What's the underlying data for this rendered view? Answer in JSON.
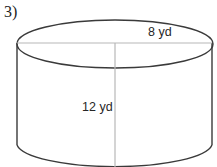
{
  "figure": {
    "problem_number": "3)",
    "shape": "cylinder",
    "diameter_label": "8 yd",
    "height_label": "12 yd",
    "colors": {
      "outline": "#3a3a3a",
      "guide_line": "#b8b8b8",
      "background": "#ffffff",
      "text": "#262626"
    },
    "geometry": {
      "center_x": 115,
      "top_ellipse_center_y": 44,
      "radius_x": 98,
      "radius_y": 24,
      "left_wall_x": 17,
      "right_wall_x": 212,
      "wall_top_y": 43,
      "wall_bottom_y": 145
    }
  },
  "measurements": {
    "diameter_value": "8",
    "height_value": "12",
    "unit": "yd"
  }
}
